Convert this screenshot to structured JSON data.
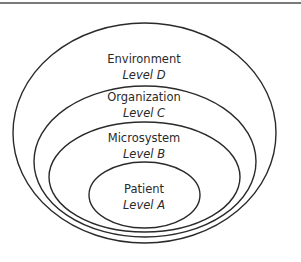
{
  "diagram": {
    "type": "nested-ellipses",
    "stroke_color": "#2a2a2a",
    "rule_color": "#7a7a7a",
    "levels": [
      {
        "name": "Environment",
        "level": "Level D"
      },
      {
        "name": "Organization",
        "level": "Level C"
      },
      {
        "name": "Microsystem",
        "level": "Level B"
      },
      {
        "name": "Patient",
        "level": "Level A"
      }
    ]
  }
}
